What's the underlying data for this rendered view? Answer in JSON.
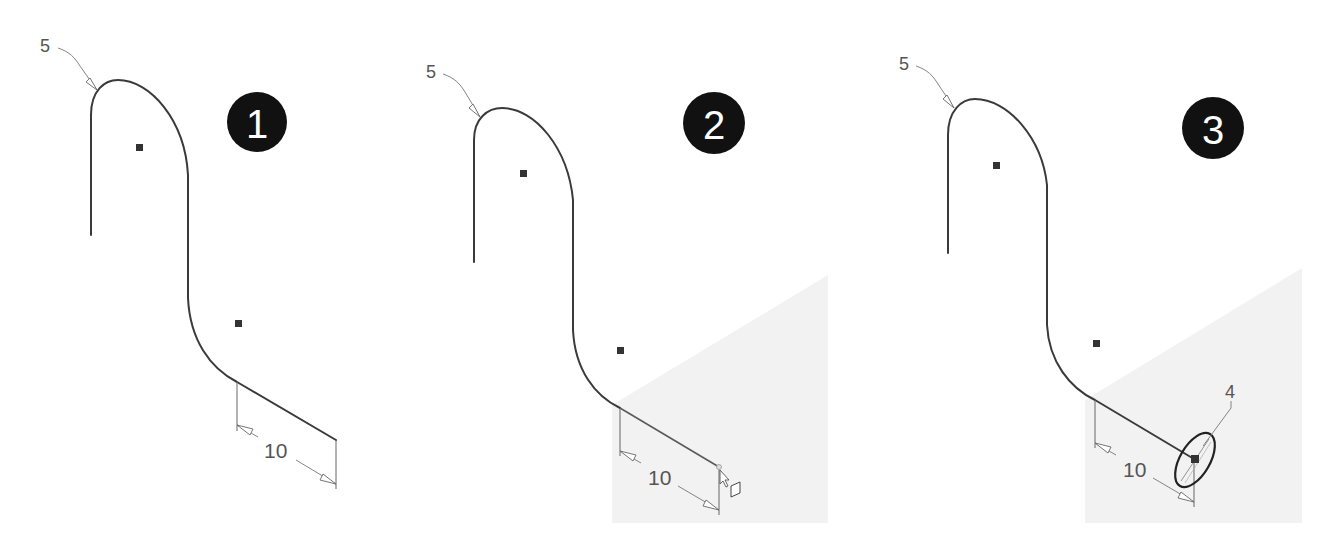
{
  "figure": {
    "panels": [
      {
        "id": "1",
        "badge": "1",
        "radius_label": "5",
        "dimension_label": "10",
        "point_label": null,
        "state": "sketch-with-dimensions"
      },
      {
        "id": "2",
        "badge": "2",
        "radius_label": "5",
        "dimension_label": "10",
        "point_label": null,
        "state": "cursor-hover-endpoint"
      },
      {
        "id": "3",
        "badge": "3",
        "radius_label": "5",
        "dimension_label": "10",
        "point_label": "4",
        "state": "endpoint-selected-ellipse"
      }
    ],
    "colors": {
      "stroke": "#3a3a3a",
      "badge_fill": "#111111",
      "shade": "#f2f2f2"
    }
  }
}
